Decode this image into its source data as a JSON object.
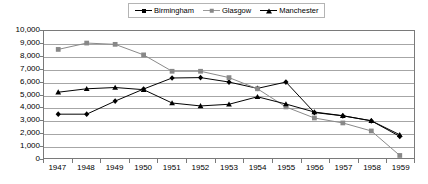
{
  "chart_data": {
    "type": "line",
    "title": "",
    "xlabel": "",
    "ylabel": "",
    "categories": [
      "1947",
      "1948",
      "1949",
      "1950",
      "1951",
      "1952",
      "1953",
      "1954",
      "1955",
      "1956",
      "1957",
      "1958",
      "1959"
    ],
    "ylim": [
      0,
      10000
    ],
    "ytick_step": 1000,
    "ytick_labels": [
      "10,000",
      "9,000",
      "8,000",
      "7,000",
      "6,000",
      "5,000",
      "4,000",
      "3,000",
      "2,000",
      "1,000",
      "0"
    ],
    "ytick_values": [
      10000,
      9000,
      8000,
      7000,
      6000,
      5000,
      4000,
      3000,
      2000,
      1000,
      0
    ],
    "grid": true,
    "legend_position": "top-center",
    "series": [
      {
        "name": "Birmingham",
        "marker": "diamond",
        "color": "#000000",
        "values": [
          3450,
          3450,
          4480,
          5430,
          6300,
          6330,
          5980,
          5480,
          5980,
          3580,
          3320,
          2930,
          1700
        ]
      },
      {
        "name": "Glasgow",
        "marker": "square",
        "color": "#888888",
        "values": [
          8550,
          9050,
          8950,
          8120,
          6830,
          6830,
          6330,
          5450,
          4020,
          3150,
          2760,
          2130,
          200
        ]
      },
      {
        "name": "Manchester",
        "marker": "triangle",
        "color": "#000000",
        "values": [
          5180,
          5450,
          5550,
          5380,
          4330,
          4100,
          4230,
          4820,
          4250,
          3620,
          3330,
          2930,
          1830
        ]
      }
    ]
  },
  "legend": {
    "items": [
      {
        "label": "Birmingham",
        "marker": "diamond",
        "color": "#000000"
      },
      {
        "label": "Glasgow",
        "marker": "square",
        "color": "#888888"
      },
      {
        "label": "Manchester",
        "marker": "triangle",
        "color": "#000000"
      }
    ]
  }
}
